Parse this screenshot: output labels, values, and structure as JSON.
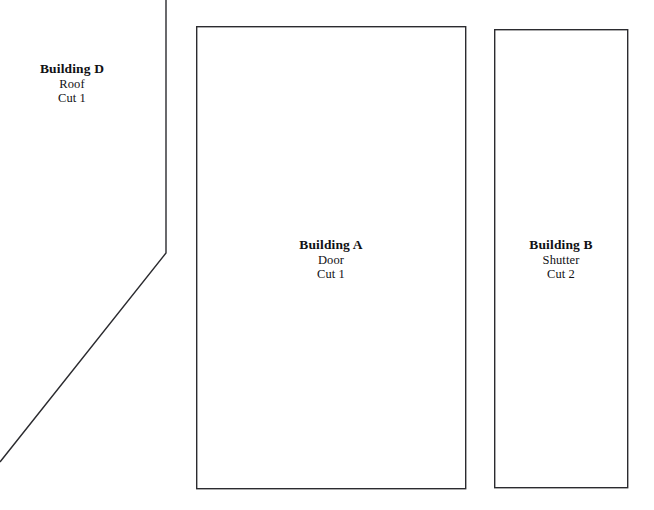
{
  "canvas": {
    "width": 654,
    "height": 510,
    "background_color": "#ffffff",
    "line_color": "#2b2b2f",
    "text_color": "#111114"
  },
  "pieces": [
    {
      "id": "building-d",
      "title": "Building D",
      "part": "Roof",
      "quantity_label": "Cut 1",
      "shape": "open-polyline",
      "points": "166,0 166,253 0,462",
      "label_x": 72,
      "label_y": 61
    },
    {
      "id": "building-a",
      "title": "Building A",
      "part": "Door",
      "quantity_label": "Cut 1",
      "shape": "rectangle",
      "x": 196,
      "y": 26,
      "width": 270,
      "height": 463,
      "label_x": 331,
      "label_y": 237
    },
    {
      "id": "building-b",
      "title": "Building B",
      "part": "Shutter",
      "quantity_label": "Cut 2",
      "shape": "rectangle",
      "x": 494,
      "y": 29,
      "width": 134,
      "height": 459,
      "label_x": 561,
      "label_y": 237
    }
  ]
}
